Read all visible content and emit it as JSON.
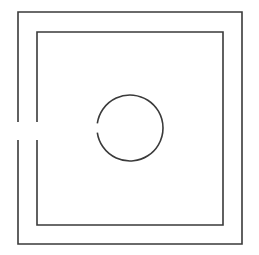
{
  "diagram": {
    "background": "#ffffff",
    "stroke_color": "#3a3a3a",
    "stroke_width": 1.6,
    "outer_square": {
      "x": 18,
      "y": 12,
      "width": 224,
      "height": 232
    },
    "inner_square": {
      "x": 37,
      "y": 32,
      "width": 186,
      "height": 193
    },
    "left_wall_opening": {
      "y_start": 122,
      "y_end": 140
    },
    "circle": {
      "cx": 130,
      "cy": 128,
      "r": 33,
      "gap_angle_start_deg": 172,
      "gap_angle_end_deg": 188
    }
  }
}
